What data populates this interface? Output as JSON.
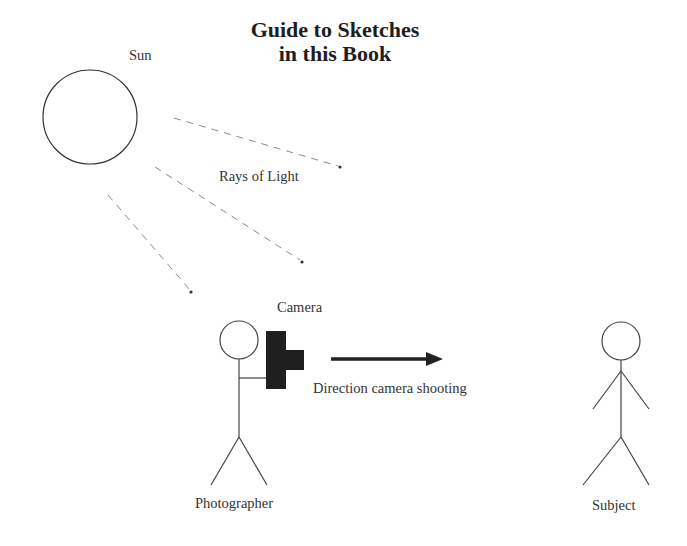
{
  "title": {
    "line1": "Guide to Sketches",
    "line2": "in this Book"
  },
  "labels": {
    "sun": "Sun",
    "rays": "Rays of Light",
    "camera": "Camera",
    "direction": "Direction camera shooting",
    "photographer": "Photographer",
    "subject": "Subject"
  },
  "colors": {
    "stroke": "#333333",
    "ray": "#8a8a8a",
    "camera_fill": "#1f1f1f",
    "arrow": "#222222",
    "background": "#ffffff"
  }
}
